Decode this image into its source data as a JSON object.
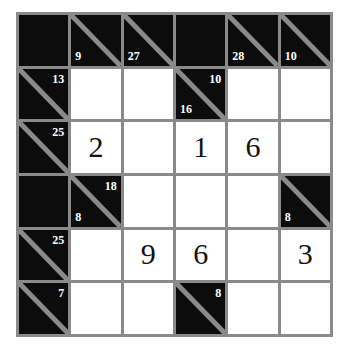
{
  "puzzle": {
    "name": "Kakuro",
    "rows": 6,
    "cols": 6,
    "colors": {
      "block": "#0c0c0c",
      "open": "#ffffff",
      "grid_line": "#8a8a8a",
      "clue_text": "#ffffff",
      "entry_text": "#111111",
      "background": "#ffffff"
    },
    "cells": [
      [
        {
          "type": "block"
        },
        {
          "type": "clue",
          "down": "9"
        },
        {
          "type": "clue",
          "down": "27"
        },
        {
          "type": "block"
        },
        {
          "type": "clue",
          "down": "28"
        },
        {
          "type": "clue",
          "down": "10"
        }
      ],
      [
        {
          "type": "clue",
          "across": "13"
        },
        {
          "type": "open",
          "value": ""
        },
        {
          "type": "open",
          "value": ""
        },
        {
          "type": "clue",
          "across": "10",
          "down": "16"
        },
        {
          "type": "open",
          "value": ""
        },
        {
          "type": "open",
          "value": ""
        }
      ],
      [
        {
          "type": "clue",
          "across": "25"
        },
        {
          "type": "open",
          "value": "2"
        },
        {
          "type": "open",
          "value": ""
        },
        {
          "type": "open",
          "value": "1"
        },
        {
          "type": "open",
          "value": "6"
        },
        {
          "type": "open",
          "value": ""
        }
      ],
      [
        {
          "type": "block"
        },
        {
          "type": "clue",
          "across": "18",
          "down": "8"
        },
        {
          "type": "open",
          "value": ""
        },
        {
          "type": "open",
          "value": ""
        },
        {
          "type": "open",
          "value": ""
        },
        {
          "type": "clue",
          "down": "8"
        }
      ],
      [
        {
          "type": "clue",
          "across": "25"
        },
        {
          "type": "open",
          "value": ""
        },
        {
          "type": "open",
          "value": "9"
        },
        {
          "type": "open",
          "value": "6"
        },
        {
          "type": "open",
          "value": ""
        },
        {
          "type": "open",
          "value": "3"
        }
      ],
      [
        {
          "type": "clue",
          "across": "7"
        },
        {
          "type": "open",
          "value": ""
        },
        {
          "type": "open",
          "value": ""
        },
        {
          "type": "clue",
          "across": "8"
        },
        {
          "type": "open",
          "value": ""
        },
        {
          "type": "open",
          "value": ""
        }
      ]
    ]
  }
}
